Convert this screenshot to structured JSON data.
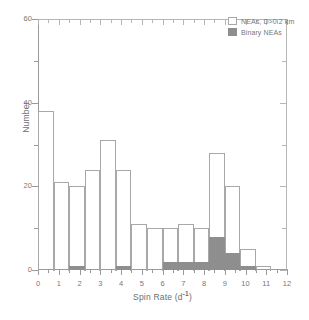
{
  "figure": {
    "background": "#ffffff",
    "frame_color": "#9a9a9a"
  },
  "legend": {
    "position": "top-right",
    "entries": [
      {
        "label": "NEAs, D>0.2 km",
        "swatch": "open-box-icon",
        "color": "#ffffff"
      },
      {
        "label": "Binary NEAs",
        "swatch": "filled-box-icon",
        "color": "#8e8e8e"
      }
    ]
  },
  "axes": {
    "x": {
      "title_main": "Spin Rate (d",
      "title_sup": "-1",
      "title_tail": ")",
      "title_full": "Spin Rate (d-1)",
      "min": 0,
      "max": 12,
      "major_ticks": [
        0,
        1,
        2,
        3,
        4,
        5,
        6,
        7,
        8,
        9,
        10,
        11,
        12
      ],
      "tick_labels": [
        "0",
        "1",
        "2",
        "3",
        "4",
        "5",
        "6",
        "7",
        "8",
        "9",
        "10",
        "11",
        "12"
      ],
      "minor_ticks": [
        0.5,
        1.5,
        2.5,
        3.5,
        4.5,
        5.5,
        6.5,
        7.5,
        8.5,
        9.5,
        10.5,
        11.5
      ]
    },
    "y": {
      "title": "Number",
      "min": 0,
      "max": 60,
      "major_ticks": [
        0,
        20,
        40,
        60
      ],
      "tick_labels": [
        "0",
        "20",
        "40",
        "60"
      ],
      "minor_ticks": [
        10,
        30,
        50
      ]
    }
  },
  "chart_data": {
    "type": "bar",
    "title": "",
    "xlabel": "Spin Rate (d-1)",
    "ylabel": "Number",
    "xlim": [
      0,
      12
    ],
    "ylim": [
      0,
      60
    ],
    "grid": false,
    "legend_position": "upper right",
    "bin_width": 0.75,
    "bin_starts": [
      0.0,
      0.75,
      1.5,
      2.25,
      3.0,
      3.75,
      4.5,
      5.25,
      6.0,
      6.75,
      7.5,
      8.25,
      9.0,
      9.75,
      10.5
    ],
    "bin_centers": [
      0.375,
      1.125,
      1.875,
      2.625,
      3.375,
      4.125,
      4.875,
      5.625,
      6.375,
      7.125,
      7.875,
      8.625,
      9.375,
      10.125,
      10.875
    ],
    "series": [
      {
        "name": "NEAs, D>0.2 km",
        "style": "open",
        "color": "#ffffff",
        "edge_color": "#a8a8a8",
        "values": [
          38,
          21,
          20,
          24,
          31,
          24,
          11,
          10,
          10,
          11,
          10,
          28,
          20,
          5,
          1
        ]
      },
      {
        "name": "Binary NEAs",
        "style": "filled",
        "color": "#8e8e8e",
        "values": [
          0,
          0,
          1,
          0,
          0,
          1,
          0,
          0,
          2,
          2,
          2,
          8,
          4,
          1,
          0
        ]
      }
    ]
  }
}
